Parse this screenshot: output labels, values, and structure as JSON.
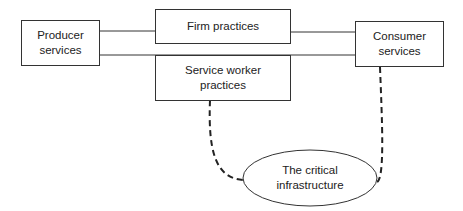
{
  "diagram": {
    "nodes": {
      "producer": {
        "label_line1": "Producer",
        "label_line2": "services"
      },
      "firm": {
        "label": "Firm practices"
      },
      "worker": {
        "label_line1": "Service worker",
        "label_line2": "practices"
      },
      "consumer": {
        "label_line1": "Consumer",
        "label_line2": "services"
      },
      "infrastructure": {
        "label_line1": "The critical",
        "label_line2": "infrastructure"
      }
    },
    "edges": [
      {
        "from": "producer",
        "to": "firm",
        "style": "solid"
      },
      {
        "from": "firm",
        "to": "consumer",
        "style": "solid"
      },
      {
        "from": "producer",
        "to": "consumer",
        "style": "solid",
        "via": "worker"
      },
      {
        "from": "worker",
        "to": "infrastructure",
        "style": "dashed"
      },
      {
        "from": "consumer",
        "to": "infrastructure",
        "style": "dashed"
      }
    ]
  }
}
